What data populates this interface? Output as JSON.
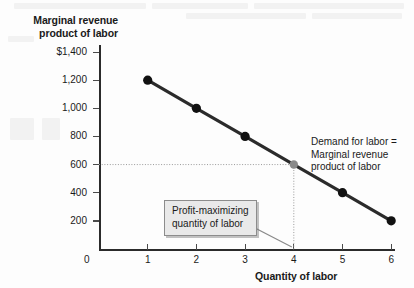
{
  "chart_data": {
    "type": "line",
    "title": "",
    "xlabel": "Quantity of labor",
    "ylabel": "Marginal revenue product of labor",
    "ylabel_line1": "Marginal revenue",
    "ylabel_line2": "product of labor",
    "x": [
      1,
      2,
      3,
      4,
      5,
      6
    ],
    "values": [
      1200,
      1000,
      800,
      600,
      400,
      200
    ],
    "series": [
      {
        "name": "Demand for labor = Marginal revenue product of labor",
        "values": [
          1200,
          1000,
          800,
          600,
          400,
          200
        ]
      }
    ],
    "xlim": [
      0,
      6.6
    ],
    "ylim": [
      0,
      1400
    ],
    "ytick_values": [
      1400,
      1200,
      1000,
      800,
      600,
      400,
      200
    ],
    "ytick_labels": [
      "$1,400",
      "1,200",
      "1,000",
      "800",
      "600",
      "400",
      "200"
    ],
    "xtick_values": [
      1,
      2,
      3,
      4,
      5,
      6
    ],
    "xtick_labels": [
      "1",
      "2",
      "3",
      "4",
      "5",
      "6"
    ],
    "origin_label": "0",
    "grid": false,
    "legend": "none",
    "highlight_point": {
      "x": 4,
      "y": 600,
      "color": "#8a8a8a"
    },
    "guide_lines": {
      "horizontal_from_y_axis_to": 600,
      "vertical_from_x_axis_to": 4,
      "style": "dotted"
    },
    "annotations": [
      {
        "name": "series-label",
        "text": "Demand for labor = Marginal revenue product of labor",
        "lines": [
          "Demand for labor =",
          "Marginal revenue",
          "product of labor"
        ]
      },
      {
        "name": "callout",
        "text": "Profit-maximizing quantity of labor",
        "lines": [
          "Profit-maximizing",
          "quantity of labor"
        ],
        "points_to_x": 4
      }
    ],
    "colors": {
      "curve": "#2b2b2b",
      "marker": "#111111",
      "highlight_marker": "#8a8a8a",
      "axis": "#2b2b2b",
      "guide": "#9a9a9a",
      "callout_bg": "#e9e9e9",
      "callout_border": "#8c8c8c",
      "background": "#fdfdfd"
    }
  },
  "axes": {
    "y_title_line1": "Marginal revenue",
    "y_title_line2": "product of labor",
    "x_title": "Quantity of labor",
    "origin": "0",
    "y_ticks": [
      {
        "label": "$1,400"
      },
      {
        "label": "1,200"
      },
      {
        "label": "1,000"
      },
      {
        "label": "800"
      },
      {
        "label": "600"
      },
      {
        "label": "400"
      },
      {
        "label": "200"
      }
    ],
    "x_ticks": [
      {
        "label": "1"
      },
      {
        "label": "2"
      },
      {
        "label": "3"
      },
      {
        "label": "4"
      },
      {
        "label": "5"
      },
      {
        "label": "6"
      }
    ]
  },
  "annotations": {
    "series_label": {
      "line1": "Demand for labor =",
      "line2": "Marginal revenue",
      "line3": "product of labor"
    },
    "callout": {
      "line1": "Profit-maximizing",
      "line2": "quantity of labor"
    }
  }
}
